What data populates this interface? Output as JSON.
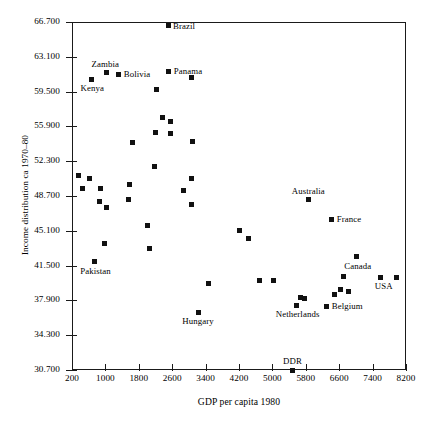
{
  "chart_data": {
    "type": "scatter",
    "title": "",
    "xlabel": "GDP per capita 1980",
    "ylabel": "Income distribution ca 1970–80",
    "xlim": [
      200,
      8200
    ],
    "ylim": [
      30.7,
      66.7
    ],
    "grid": false,
    "legend": "none",
    "xticks": [
      "200",
      "1000",
      "1800",
      "2600",
      "3400",
      "4200",
      "5000",
      "5800",
      "6600",
      "7400",
      "8200"
    ],
    "xtick_values": [
      200,
      1000,
      1800,
      2600,
      3400,
      4200,
      5000,
      5800,
      6600,
      7400,
      8200
    ],
    "yticks": [
      "30.700",
      "34.300",
      "37.900",
      "41.500",
      "45.100",
      "48.700",
      "52.300",
      "55.900",
      "59.500",
      "63.100",
      "66.700"
    ],
    "ytick_values": [
      30.7,
      34.3,
      37.9,
      41.5,
      45.1,
      48.7,
      52.3,
      55.9,
      59.5,
      63.1,
      66.7
    ],
    "marker": "filled-square",
    "marker_color": "#111111",
    "axis_color": "#1a1a1a",
    "points": [
      {
        "x": 2500,
        "y": 66.3,
        "label": "Brazil",
        "label_pos": "right"
      },
      {
        "x": 1020,
        "y": 61.5,
        "label": "Zambia",
        "label_pos": "above-left"
      },
      {
        "x": 660,
        "y": 60.8,
        "label": "Kenya",
        "label_pos": "below-left"
      },
      {
        "x": 1320,
        "y": 61.3,
        "label": "Bolivia",
        "label_pos": "right"
      },
      {
        "x": 2520,
        "y": 61.6,
        "label": "Panama",
        "label_pos": "right"
      },
      {
        "x": 2220,
        "y": 59.7,
        "label": "",
        "label_pos": ""
      },
      {
        "x": 3060,
        "y": 61.0,
        "label": "",
        "label_pos": ""
      },
      {
        "x": 2360,
        "y": 56.8,
        "label": "",
        "label_pos": ""
      },
      {
        "x": 2560,
        "y": 56.4,
        "label": "",
        "label_pos": ""
      },
      {
        "x": 2200,
        "y": 55.3,
        "label": "",
        "label_pos": ""
      },
      {
        "x": 2560,
        "y": 55.2,
        "label": "",
        "label_pos": ""
      },
      {
        "x": 1660,
        "y": 54.2,
        "label": "",
        "label_pos": ""
      },
      {
        "x": 3080,
        "y": 54.3,
        "label": "",
        "label_pos": ""
      },
      {
        "x": 2180,
        "y": 51.8,
        "label": "",
        "label_pos": ""
      },
      {
        "x": 360,
        "y": 50.8,
        "label": "",
        "label_pos": ""
      },
      {
        "x": 620,
        "y": 50.5,
        "label": "",
        "label_pos": ""
      },
      {
        "x": 3060,
        "y": 50.5,
        "label": "",
        "label_pos": ""
      },
      {
        "x": 460,
        "y": 49.5,
        "label": "",
        "label_pos": ""
      },
      {
        "x": 880,
        "y": 49.5,
        "label": "",
        "label_pos": ""
      },
      {
        "x": 1580,
        "y": 49.9,
        "label": "",
        "label_pos": ""
      },
      {
        "x": 2880,
        "y": 49.3,
        "label": "",
        "label_pos": ""
      },
      {
        "x": 860,
        "y": 48.1,
        "label": "",
        "label_pos": ""
      },
      {
        "x": 1560,
        "y": 48.3,
        "label": "",
        "label_pos": ""
      },
      {
        "x": 3060,
        "y": 47.8,
        "label": "",
        "label_pos": ""
      },
      {
        "x": 1020,
        "y": 47.5,
        "label": "",
        "label_pos": ""
      },
      {
        "x": 5860,
        "y": 48.3,
        "label": "Australia",
        "label_pos": "above"
      },
      {
        "x": 6420,
        "y": 46.3,
        "label": "France",
        "label_pos": "right"
      },
      {
        "x": 2020,
        "y": 45.6,
        "label": "",
        "label_pos": ""
      },
      {
        "x": 4220,
        "y": 45.1,
        "label": "",
        "label_pos": ""
      },
      {
        "x": 4420,
        "y": 44.3,
        "label": "",
        "label_pos": ""
      },
      {
        "x": 980,
        "y": 43.8,
        "label": "",
        "label_pos": ""
      },
      {
        "x": 2060,
        "y": 43.3,
        "label": "",
        "label_pos": ""
      },
      {
        "x": 7020,
        "y": 42.4,
        "label": "Canada",
        "label_pos": "below-left"
      },
      {
        "x": 740,
        "y": 41.9,
        "label": "Pakistan",
        "label_pos": "below-left"
      },
      {
        "x": 3480,
        "y": 39.7,
        "label": "",
        "label_pos": ""
      },
      {
        "x": 4700,
        "y": 40.0,
        "label": "",
        "label_pos": ""
      },
      {
        "x": 5020,
        "y": 40.0,
        "label": "",
        "label_pos": ""
      },
      {
        "x": 7580,
        "y": 40.3,
        "label": "USA",
        "label_pos": "below-right"
      },
      {
        "x": 7980,
        "y": 40.3,
        "label": "",
        "label_pos": ""
      },
      {
        "x": 6700,
        "y": 40.4,
        "label": "",
        "label_pos": ""
      },
      {
        "x": 6620,
        "y": 39.0,
        "label": "",
        "label_pos": ""
      },
      {
        "x": 6820,
        "y": 38.8,
        "label": "",
        "label_pos": ""
      },
      {
        "x": 6480,
        "y": 38.5,
        "label": "",
        "label_pos": ""
      },
      {
        "x": 5680,
        "y": 38.2,
        "label": "",
        "label_pos": ""
      },
      {
        "x": 5760,
        "y": 38.1,
        "label": "",
        "label_pos": ""
      },
      {
        "x": 6300,
        "y": 37.3,
        "label": "Belgium",
        "label_pos": "right"
      },
      {
        "x": 5580,
        "y": 37.4,
        "label": "Netherlands",
        "label_pos": "below-left"
      },
      {
        "x": 3220,
        "y": 36.7,
        "label": "Hungary",
        "label_pos": "below"
      },
      {
        "x": 5480,
        "y": 30.7,
        "label": "DDR",
        "label_pos": "above"
      }
    ]
  }
}
